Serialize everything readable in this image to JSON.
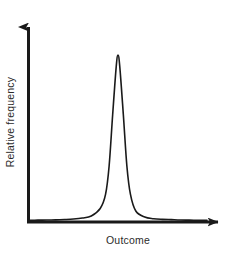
{
  "chart_data": {
    "type": "line",
    "title": "",
    "subtitle": "",
    "xlabel": "Outcome",
    "ylabel": "Relative frequency",
    "grid": false,
    "legend": null,
    "axis_style": "arrow",
    "tick_labels": {
      "x": [],
      "y": []
    },
    "xlim": [
      0,
      1
    ],
    "ylim": [
      0,
      1
    ],
    "series": [
      {
        "name": "Relative frequency distribution",
        "color": "#1a1a1a",
        "x": [
          0.0,
          0.05,
          0.1,
          0.15,
          0.2,
          0.25,
          0.3,
          0.35,
          0.4,
          0.43,
          0.45,
          0.47,
          0.49,
          0.5,
          0.51,
          0.53,
          0.55,
          0.57,
          0.6,
          0.65,
          0.7,
          0.75,
          0.8,
          0.85,
          0.9,
          0.95,
          1.0
        ],
        "y": [
          0.004,
          0.005,
          0.006,
          0.007,
          0.009,
          0.012,
          0.018,
          0.03,
          0.075,
          0.16,
          0.33,
          0.64,
          0.93,
          1.0,
          0.93,
          0.64,
          0.33,
          0.16,
          0.06,
          0.024,
          0.014,
          0.01,
          0.008,
          0.006,
          0.005,
          0.004,
          0.004
        ]
      }
    ]
  },
  "axes": {
    "x_axis_name": "x-axis-arrow",
    "y_axis_name": "y-axis-arrow"
  }
}
